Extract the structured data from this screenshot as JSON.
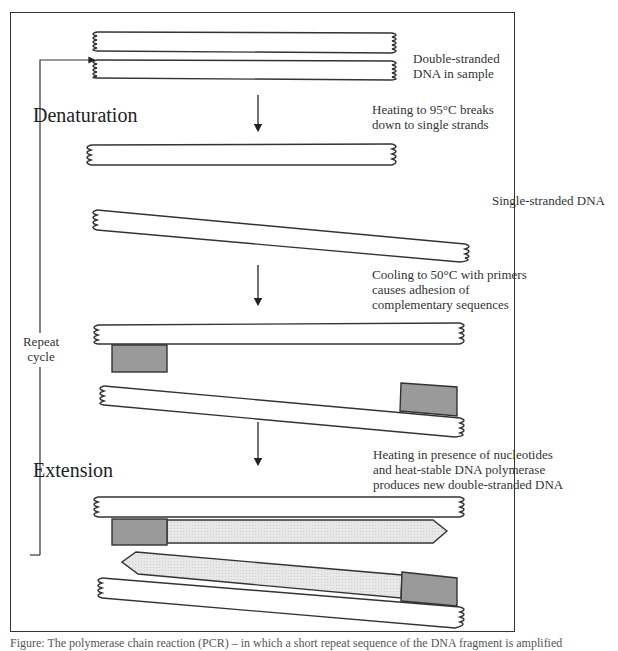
{
  "diagram": {
    "stages": [
      {
        "id": "sample",
        "label": "Double-stranded DNA in sample"
      },
      {
        "id": "denaturation",
        "heading": "Denaturation",
        "step": "Heating to 95°C breaks down to single strands"
      },
      {
        "id": "single",
        "label": "Single-stranded DNA"
      },
      {
        "id": "annealing",
        "step": "Cooling to 50°C with primers causes adhesion of complementary sequences"
      },
      {
        "id": "extension",
        "heading": "Extension",
        "step": "Heating in presence of nucleotides and heat-stable DNA polymerase produces new double-stranded DNA"
      }
    ],
    "loop_label": "Repeat cycle",
    "colors": {
      "primer": "#9a9a9a",
      "new_strand": "#e6e6e6",
      "outline": "#333333"
    }
  },
  "labels": {
    "sample_l1": "Double-stranded",
    "sample_l2": "DNA in sample",
    "denaturation": "Denaturation",
    "heat_l1": "Heating to 95°C breaks",
    "heat_l2": "down to single strands",
    "single": "Single-stranded DNA",
    "cool_l1": "Cooling to 50°C with primers",
    "cool_l2": "causes adhesion of",
    "cool_l3": "complementary sequences",
    "repeat_l1": "Repeat",
    "repeat_l2": "cycle",
    "extension": "Extension",
    "ext_l1": "Heating in presence of nucleotides",
    "ext_l2": "and heat-stable DNA polymerase",
    "ext_l3": "produces new double-stranded DNA"
  },
  "caption": "Figure: The polymerase chain reaction (PCR) – in which a short repeat sequence of the DNA fragment is amplified"
}
